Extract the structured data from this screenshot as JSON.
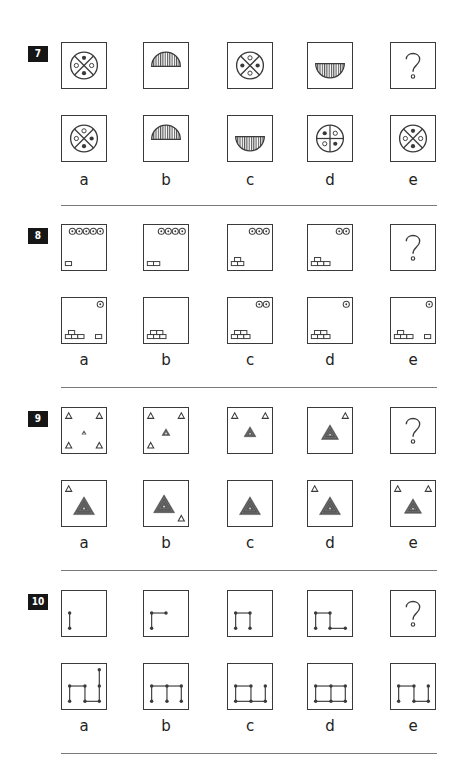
{
  "questions": [
    {
      "number": "7",
      "top": 42,
      "problem": [
        "circle-x-dots-v",
        "half-disc-up",
        "circle-x-dots-h",
        "half-disc-down",
        "question"
      ],
      "answers": [
        "circle-x-dots-a",
        "half-disc-up",
        "half-disc-down",
        "circle-plus-dots",
        "circle-x-dots-v"
      ],
      "labels": [
        "a",
        "b",
        "c",
        "d",
        "e"
      ]
    },
    {
      "number": "8",
      "top": 224,
      "problem": [
        "coins5-brick1",
        "coins4-brick2",
        "coins3-brick3",
        "coins2-brick4",
        "question"
      ],
      "answers": [
        "coin1-brick4-plus1",
        "coins0-brick5",
        "coins2-brick5",
        "coin1-brick5",
        "coin1-brick3-plus1"
      ],
      "labels": [
        "a",
        "b",
        "c",
        "d",
        "e"
      ]
    },
    {
      "number": "9",
      "top": 407,
      "problem": [
        "tri-4corners-small",
        "tri-3corners-med",
        "tri-2corners-large",
        "tri-1corner-xlarge",
        "question"
      ],
      "answers": [
        "tri-big-tl",
        "tri-big-br",
        "tri-big-none",
        "tri-big-tl2",
        "tri-med-2top"
      ],
      "labels": [
        "a",
        "b",
        "c",
        "d",
        "e"
      ]
    },
    {
      "number": "10",
      "top": 590,
      "problem": [
        "path1",
        "path2",
        "path3",
        "path4",
        "question"
      ],
      "answers": [
        "ans-a",
        "ans-b",
        "ans-c",
        "ans-d",
        "ans-e"
      ],
      "labels": [
        "a",
        "b",
        "c",
        "d",
        "e"
      ]
    }
  ],
  "columns": [
    61,
    143,
    227,
    307,
    390
  ],
  "question_mark": "?"
}
